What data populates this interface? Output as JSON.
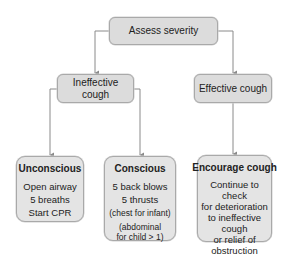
{
  "diagram": {
    "type": "flowchart",
    "colors": {
      "node_fill": "#dcdcdc",
      "action_fill": "#e4e4e4",
      "node_border": "#a9a9a9",
      "connector": "#8a8a8a"
    },
    "nodes": {
      "assess": {
        "label": "Assess severity"
      },
      "ineffective": {
        "label": "Ineffective cough"
      },
      "effective": {
        "label": "Effective cough"
      },
      "unconscious": {
        "title": "Unconscious",
        "steps": [
          "Open airway",
          "5 breaths",
          "Start CPR"
        ]
      },
      "conscious": {
        "title": "Conscious",
        "steps": [
          "5 back blows",
          "5 thrusts"
        ],
        "notes": [
          "(chest for infant)",
          "(abdominal",
          "for child > 1)"
        ]
      },
      "encourage": {
        "title": "Encourage cough",
        "body": "Continue to check\nfor deterioration\nto ineffective\ncough\nor relief of\nobstruction"
      }
    },
    "edges": [
      {
        "from": "assess",
        "to": "ineffective"
      },
      {
        "from": "assess",
        "to": "effective"
      },
      {
        "from": "ineffective",
        "to": "unconscious"
      },
      {
        "from": "ineffective",
        "to": "conscious"
      },
      {
        "from": "effective",
        "to": "encourage"
      }
    ]
  }
}
